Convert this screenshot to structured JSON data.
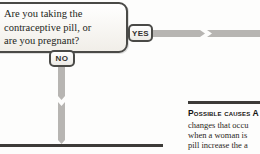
{
  "colors": {
    "arrow": "#b7b5b2",
    "rule": "#3d3b38",
    "box_border": "#4a4a47"
  },
  "flowchart": {
    "question": {
      "lines": {
        "0": "Are you taking the",
        "1": "contraceptive pill, or",
        "2": "are you pregnant?"
      }
    },
    "yes_label": "YES",
    "no_label": "NO"
  },
  "info_panel": {
    "heading": "Possible causes A",
    "body_lines": {
      "0": "changes that occu",
      "1": "when a woman is",
      "2": "pill increase the a"
    }
  }
}
